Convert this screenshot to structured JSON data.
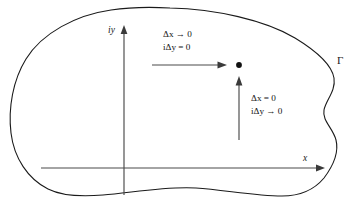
{
  "figure": {
    "region_label": "Γ",
    "axes": {
      "vertical_label": "iy",
      "horizontal_label": "x"
    },
    "annotations": [
      {
        "id": "horizontal-limit",
        "line1": "Δx → 0",
        "line2": "iΔy = 0",
        "direction": "horizontal"
      },
      {
        "id": "vertical-limit",
        "line1": "Δx = 0",
        "line2": "iΔy → 0",
        "direction": "vertical"
      }
    ],
    "point": {
      "name": "limit-point"
    },
    "colors": {
      "boundary": "#1a1a1a",
      "axis": "#4a4a4a",
      "text": "#141414",
      "background": "#ffffff"
    }
  }
}
